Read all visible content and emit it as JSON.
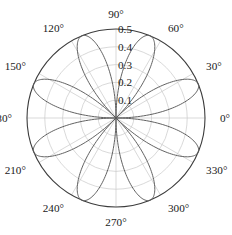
{
  "chart_data": {
    "type": "line",
    "subtype": "polar-rose",
    "title": "",
    "xlabel": "",
    "ylabel": "",
    "projection": "polar",
    "grid": true,
    "legend": null,
    "theta_direction": "counterclockwise",
    "theta_zero_location": "E",
    "rlim": [
      0,
      0.5
    ],
    "angle_unit": "degrees",
    "angle_tick_labels": [
      "0°",
      "30°",
      "60°",
      "90°",
      "120°",
      "150°",
      "180°",
      "210°",
      "240°",
      "270°",
      "300°",
      "330°"
    ],
    "angle_tick_values": [
      0,
      30,
      60,
      90,
      120,
      150,
      180,
      210,
      240,
      270,
      300,
      330
    ],
    "radial_tick_labels": [
      "0.1",
      "0.2",
      "0.3",
      "0.4",
      "0.5"
    ],
    "radial_tick_values": [
      0.1,
      0.2,
      0.3,
      0.4,
      0.5
    ],
    "radial_label_angle": 90,
    "petal_count": 8,
    "petal_peak_angles": [
      22.5,
      67.5,
      112.5,
      157.5,
      202.5,
      247.5,
      292.5,
      337.5
    ],
    "peak_radius": 0.5,
    "equation": "r = 0.5 |cos(4(theta - 22.5°))|",
    "series": [
      {
        "name": "rose",
        "color": "#5a5a5a",
        "values": [
          0.5,
          0.5,
          0.5,
          0.5,
          0.5,
          0.5,
          0.5,
          0.5
        ]
      }
    ]
  },
  "axes": {
    "angle_labels": [
      {
        "text": "0°",
        "deg": 0
      },
      {
        "text": "30°",
        "deg": 30
      },
      {
        "text": "60°",
        "deg": 60
      },
      {
        "text": "90°",
        "deg": 90
      },
      {
        "text": "120°",
        "deg": 120
      },
      {
        "text": "150°",
        "deg": 150
      },
      {
        "text": "180°",
        "deg": 180
      },
      {
        "text": "210°",
        "deg": 210
      },
      {
        "text": "240°",
        "deg": 240
      },
      {
        "text": "270°",
        "deg": 270
      },
      {
        "text": "300°",
        "deg": 300
      },
      {
        "text": "330°",
        "deg": 330
      }
    ],
    "radial_labels": [
      {
        "text": "0.1",
        "value": 0.1
      },
      {
        "text": "0.2",
        "value": 0.2
      },
      {
        "text": "0.3",
        "value": 0.3
      },
      {
        "text": "0.4",
        "value": 0.4
      },
      {
        "text": "0.5",
        "value": 0.5
      }
    ]
  },
  "colors": {
    "curve": "#5a5a5a",
    "outer_ring": "#3c3c3c",
    "grid": "#c9c9c9",
    "text": "#1a1a1a",
    "background": "#ffffff"
  }
}
